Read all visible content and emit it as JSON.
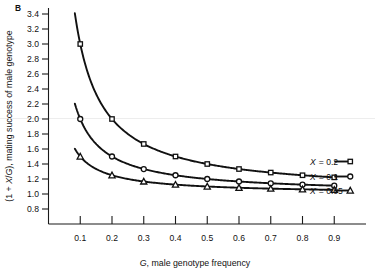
{
  "panel": {
    "label": "B"
  },
  "chart_data": {
    "type": "line",
    "title": "",
    "xlabel": "G, male genotype frequency",
    "ylabel": "(1 + X/G), mating success of male genotype",
    "xlim": [
      0.0,
      1.0
    ],
    "ylim": [
      0.7,
      3.5
    ],
    "grid": false,
    "legend_position": "right",
    "x": [
      0.1,
      0.2,
      0.3,
      0.4,
      0.5,
      0.6,
      0.7,
      0.8,
      0.9
    ],
    "xticks": [
      "0.1",
      "0.2",
      "0.3",
      "0.4",
      "0.5",
      "0.6",
      "0.7",
      "0.8",
      "0.9"
    ],
    "yticks": [
      "0.8",
      "1.0",
      "1.2",
      "1.4",
      "1.6",
      "1.8",
      "2.0",
      "2.2",
      "2.4",
      "2.6",
      "2.8",
      "3.0",
      "3.2",
      "3.4"
    ],
    "series": [
      {
        "name": "X = 0.2",
        "marker": "square",
        "X": 0.2,
        "values": [
          3.0,
          2.0,
          1.667,
          1.5,
          1.4,
          1.333,
          1.286,
          1.25,
          1.222
        ]
      },
      {
        "name": "X = 0.1",
        "marker": "circle",
        "X": 0.1,
        "values": [
          2.0,
          1.5,
          1.333,
          1.25,
          1.2,
          1.167,
          1.143,
          1.125,
          1.111
        ]
      },
      {
        "name": "X = 0.05",
        "marker": "triangle",
        "X": 0.05,
        "values": [
          1.5,
          1.25,
          1.167,
          1.125,
          1.1,
          1.083,
          1.071,
          1.063,
          1.056
        ]
      }
    ],
    "legend": [
      {
        "text": "X = 0.2",
        "marker": "square"
      },
      {
        "text": "X = 0.1",
        "marker": "circle"
      },
      {
        "text": "X = 0.05",
        "marker": "triangle"
      }
    ]
  }
}
